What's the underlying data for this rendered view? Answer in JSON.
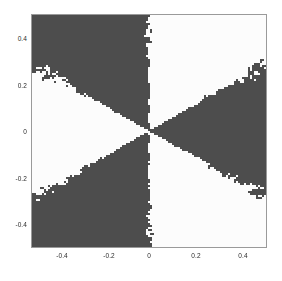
{
  "figure": {
    "background_color": "#ffffff",
    "plot_frame_color": "#9a9a9a",
    "title": "",
    "width": 282,
    "height": 281
  },
  "axes": {
    "x": {
      "label": "",
      "lim": [
        -0.5,
        0.5
      ],
      "ticks": [
        -0.4,
        -0.2,
        0,
        0.2,
        0.4
      ],
      "tick_labels": [
        "-0.4",
        "-0.2",
        "0",
        "0.2",
        "0.4"
      ]
    },
    "y": {
      "label": "",
      "lim": [
        -0.5,
        0.5
      ],
      "ticks": [
        -0.4,
        -0.2,
        0,
        0.2,
        0.4
      ],
      "tick_labels": [
        "-0.4",
        "-0.2",
        "0",
        "0.2",
        "0.4"
      ]
    }
  },
  "chart_data": {
    "type": "heatmap",
    "title": "",
    "xlabel": "",
    "ylabel": "",
    "xlim": [
      -0.5,
      0.5
    ],
    "ylim": [
      -0.5,
      0.5
    ],
    "grid": false,
    "legend": "none",
    "colors": [
      "#4d4d4d",
      "#fcfcfc"
    ],
    "color_names": [
      "dark-gray-basin",
      "white-basin"
    ],
    "origin": [
      0,
      0
    ],
    "sector_count": 6,
    "sector_width_degrees": 60,
    "sector_boundaries_degrees": [
      90,
      150,
      210,
      270,
      330,
      30
    ],
    "sectors": [
      {
        "start_deg": 90,
        "end_deg": 150,
        "value": 0,
        "color": "#4d4d4d",
        "label": "upper-left-dark"
      },
      {
        "start_deg": 150,
        "end_deg": 210,
        "value": 1,
        "color": "#fcfcfc",
        "label": "left-white"
      },
      {
        "start_deg": 210,
        "end_deg": 270,
        "value": 0,
        "color": "#4d4d4d",
        "label": "lower-left-dark"
      },
      {
        "start_deg": 270,
        "end_deg": 330,
        "value": 1,
        "color": "#fcfcfc",
        "label": "lower-right-white"
      },
      {
        "start_deg": 330,
        "end_deg": 30,
        "value": 0,
        "color": "#4d4d4d",
        "label": "right-dark"
      },
      {
        "start_deg": 30,
        "end_deg": 90,
        "value": 1,
        "color": "#fcfcfc",
        "label": "upper-right-white"
      }
    ],
    "corner_values": {
      "top_left": 0,
      "top_right": 1,
      "bottom_left": 1,
      "bottom_right": 0
    },
    "boundary_noise": {
      "enabled": true,
      "type": "fractal-speckle",
      "amplitude_degrees": 5,
      "note": "Boundaries are not clean lines; blocky islands of the opposite color intrude along every sector edge, growing in size away from the origin."
    },
    "grid_resolution": [
      117,
      116
    ]
  }
}
